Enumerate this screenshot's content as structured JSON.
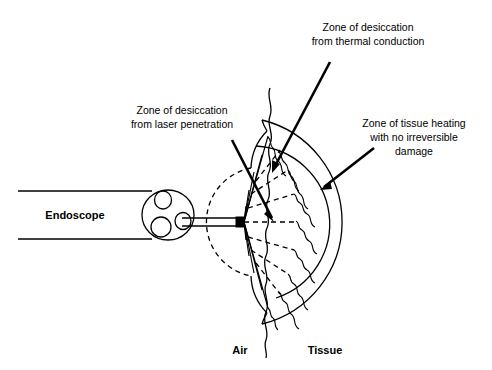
{
  "figure": {
    "background_color": "#ffffff",
    "line_color": "#000000",
    "width": 492,
    "height": 370
  },
  "labels": {
    "endoscope": "Endoscope",
    "air": "Air",
    "tissue": "Tissue",
    "zone_laser_penetration": {
      "line1": "Zone of desiccation",
      "line2": "from laser penetration"
    },
    "zone_thermal_conduction": {
      "line1": "Zone of desiccation",
      "line2": "from thermal conduction"
    },
    "zone_tissue_heating": {
      "line1": "Zone of tissue heating",
      "line2": "with no irreversible",
      "line3": "damage"
    }
  },
  "geometry": {
    "apex_x": 240,
    "apex_y": 222,
    "zone_radii": [
      55,
      78,
      105
    ],
    "fan_half_angle_deg": 78,
    "ray_count": 9
  }
}
